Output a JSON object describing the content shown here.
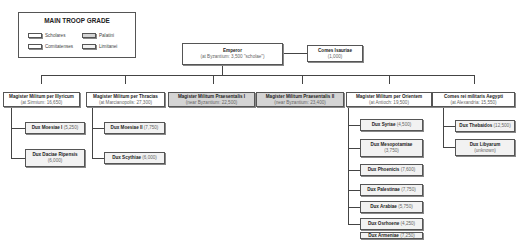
{
  "legend": {
    "title": "MAIN TROOP GRADE",
    "items": [
      {
        "label": "Scholares",
        "fill": "#ffffff"
      },
      {
        "label": "Palatini",
        "fill": "#d4d4d4"
      },
      {
        "label": "Comitatenses",
        "fill": "#ffffff"
      },
      {
        "label": "Limitanei",
        "fill": "#f2f2f2"
      }
    ]
  },
  "emperor": {
    "title": "Emperor",
    "sub": "(at Byzantium: 3,500 \"scholae\")"
  },
  "comes_isauriae": {
    "title": "Comes Isauriae",
    "sub": "(1,000)"
  },
  "magistri": [
    {
      "title": "Magister Militum per Illyricum",
      "sub": "(at Sirmium: 16,650)"
    },
    {
      "title": "Magister Militum per Thracias",
      "sub": "(at Marcianopolis: 27,300)"
    },
    {
      "title": "Magister Militum Praesentalis I",
      "sub": "(near Byzantium: 22,500)"
    },
    {
      "title": "Magister Militum Praesentalis II",
      "sub": "(near Byzantium: 23,400)"
    },
    {
      "title": "Magister Militum per Orientem",
      "sub": "(at Antioch: 19,500)"
    },
    {
      "title": "Comes rei militaris Aegypti",
      "sub": "(at Alexandria: 15,550)"
    }
  ],
  "duces": {
    "illyricum": [
      {
        "title": "Dux Moesiae I",
        "sub": "(5,250)"
      },
      {
        "title": "Dux Daciae Ripensis",
        "sub": "(6,000)"
      }
    ],
    "thracias": [
      {
        "title": "Dux Moesiae II",
        "sub": "(7,750)"
      },
      {
        "title": "Dux Scythiae",
        "sub": "(6,000)"
      }
    ],
    "orientem": [
      {
        "title": "Dux Syriae",
        "sub": "(4,500)"
      },
      {
        "title": "Dux Mesopotamiae",
        "sub": "(3,750)"
      },
      {
        "title": "Dux Phoenicis",
        "sub": "(7,600)"
      },
      {
        "title": "Dux Palestinae",
        "sub": "(7,750)"
      },
      {
        "title": "Dux Arabiae",
        "sub": "(5,750)"
      },
      {
        "title": "Dux Osrhoene",
        "sub": "(4,250)"
      },
      {
        "title": "Dux Armeniae",
        "sub": "(7,250)"
      }
    ],
    "aegypti": [
      {
        "title": "Dux Thebaidos",
        "sub": "(12,500)"
      },
      {
        "title": "Dux Libyarum",
        "sub": "(unknown)"
      }
    ]
  }
}
